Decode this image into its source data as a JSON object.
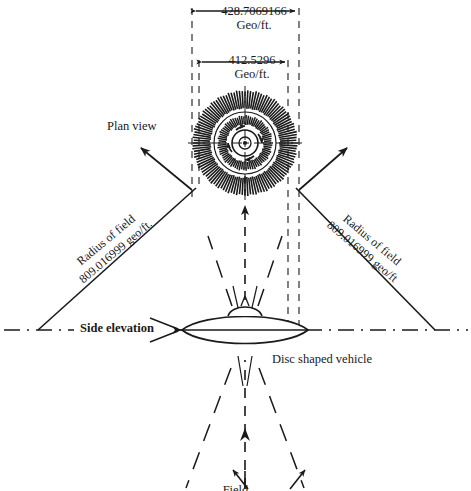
{
  "figure": {
    "background_color": "#ffffff",
    "ink_color": "#1a1a1a"
  },
  "dimensions": {
    "outer": {
      "value": "428.7069166",
      "unit": "Geo/ft.",
      "name": "outer field diameter"
    },
    "inner": {
      "value": "412.5296",
      "unit": "Geo/ft.",
      "name": "inner field diameter"
    }
  },
  "labels": {
    "plan_view": "Plan view",
    "side_elevation": "Side elevation",
    "disc_vehicle": "Disc shaped vehicle",
    "bottom_caption": "Field"
  },
  "radius_annotations": [
    {
      "side": "left",
      "line1": "Radius of field",
      "line2": "809.016999 geo/ft.",
      "rotation_deg": -40
    },
    {
      "side": "right",
      "line1": "Radius of field",
      "line2": "809.016999 geo/ft",
      "rotation_deg": 40
    }
  ],
  "plan_view": {
    "name": "plan-view-field-rings",
    "center": [
      245,
      143
    ],
    "hub_radius": 13,
    "inner_band_radius": 30,
    "outer_band_radius": 53,
    "rotation_arrows": 4
  },
  "side_elevation": {
    "name": "disc-shaped-vehicle",
    "center": [
      245,
      330
    ],
    "half_width": 63,
    "half_height": 17
  },
  "chart_data": {
    "type": "diagram",
    "measurements": [
      {
        "label": "Outer field diameter",
        "value": 428.7069166,
        "unit": "Geo/ft."
      },
      {
        "label": "Inner field diameter",
        "value": 412.5296,
        "unit": "Geo/ft."
      },
      {
        "label": "Radius of field (left)",
        "value": 809.016999,
        "unit": "geo/ft."
      },
      {
        "label": "Radius of field (right)",
        "value": 809.016999,
        "unit": "geo/ft."
      }
    ],
    "views": [
      "Plan view",
      "Side elevation"
    ],
    "subject": "Disc shaped vehicle"
  }
}
